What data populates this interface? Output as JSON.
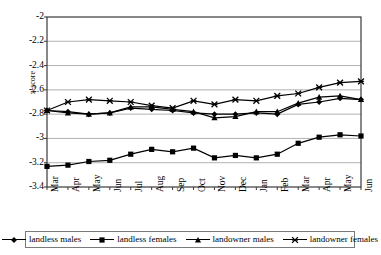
{
  "chart": {
    "type": "line",
    "ylabel": "z-score",
    "xlabel": ""
  },
  "axis": {
    "y_ticks": [
      "-2",
      "-2.2",
      "-2.4",
      "-2.6",
      "-2.8",
      "-3",
      "-3.2",
      "-3.4"
    ],
    "x_ticks": [
      "Mar",
      "Apr",
      "May",
      "Jun",
      "Jul",
      "Aug",
      "Sep",
      "Oct",
      "Nov",
      "Dec",
      "Jan",
      "Feb",
      "Mar",
      "Apr",
      "May",
      "Jun"
    ]
  },
  "legend": {
    "position": "bottom",
    "entries": [
      {
        "label": "landless males",
        "marker": "diamond",
        "color": "#000000"
      },
      {
        "label": "landless females",
        "marker": "square",
        "color": "#000000"
      },
      {
        "label": "landowner males",
        "marker": "triangle",
        "color": "#000000"
      },
      {
        "label": "landowner females",
        "marker": "star",
        "color": "#000000"
      }
    ]
  },
  "chart_data": {
    "type": "line",
    "title": "",
    "xlabel": "",
    "ylabel": "z-score",
    "ylim": [
      -3.4,
      -2.0
    ],
    "ytick_step": 0.2,
    "grid": true,
    "legend_position": "bottom",
    "categories": [
      "Mar",
      "Apr",
      "May",
      "Jun",
      "Jul",
      "Aug",
      "Sep",
      "Oct",
      "Nov",
      "Dec",
      "Jan",
      "Feb",
      "Mar",
      "Apr",
      "May",
      "Jun"
    ],
    "series": [
      {
        "name": "landless males",
        "marker": "diamond",
        "color": "#000000",
        "values": [
          -2.77,
          -2.78,
          -2.8,
          -2.79,
          -2.75,
          -2.76,
          -2.77,
          -2.79,
          -2.8,
          -2.8,
          -2.79,
          -2.8,
          -2.72,
          -2.7,
          -2.67,
          -2.68
        ]
      },
      {
        "name": "landless females",
        "marker": "square",
        "color": "#000000",
        "values": [
          -3.23,
          -3.22,
          -3.19,
          -3.18,
          -3.13,
          -3.09,
          -3.11,
          -3.08,
          -3.16,
          -3.14,
          -3.16,
          -3.13,
          -3.04,
          -2.99,
          -2.97,
          -2.98
        ]
      },
      {
        "name": "landowner males",
        "marker": "triangle",
        "color": "#000000",
        "values": [
          -2.77,
          -2.79,
          -2.8,
          -2.79,
          -2.74,
          -2.74,
          -2.76,
          -2.78,
          -2.83,
          -2.82,
          -2.78,
          -2.78,
          -2.71,
          -2.66,
          -2.65,
          -2.68
        ]
      },
      {
        "name": "landowner females",
        "marker": "star",
        "color": "#000000",
        "values": [
          -2.77,
          -2.7,
          -2.68,
          -2.69,
          -2.7,
          -2.73,
          -2.75,
          -2.69,
          -2.72,
          -2.68,
          -2.69,
          -2.65,
          -2.63,
          -2.58,
          -2.54,
          -2.53
        ]
      }
    ]
  }
}
